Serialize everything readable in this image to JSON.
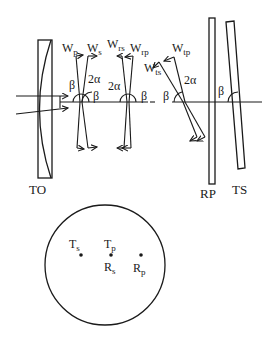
{
  "diagram": {
    "optics": {
      "labels": {
        "objective": "TO",
        "reflector_p": "RP",
        "reflector_s": "TS"
      },
      "vectors": {
        "wp": {
          "main": "W",
          "sub": "p"
        },
        "ws": {
          "main": "W",
          "sub": "s"
        },
        "wrs": {
          "main": "W",
          "sub": "rs"
        },
        "wrp": {
          "main": "W",
          "sub": "rp"
        },
        "wts": {
          "main": "W",
          "sub": "ts"
        },
        "wtp": {
          "main": "W",
          "sub": "tp"
        }
      },
      "angles": {
        "beta": "β",
        "two_alpha": "2α"
      }
    },
    "spot_plot": {
      "points": [
        {
          "main": "T",
          "sub": "s"
        },
        {
          "main": "T",
          "sub": "p"
        },
        {
          "main": "R",
          "sub": "s"
        },
        {
          "main": "R",
          "sub": "p"
        }
      ]
    }
  }
}
